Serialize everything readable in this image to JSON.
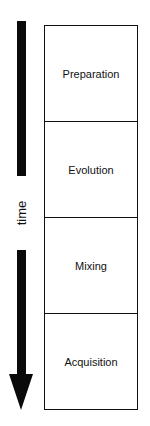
{
  "timeline": {
    "label": "time",
    "direction": "down"
  },
  "stages": [
    {
      "label": "Preparation"
    },
    {
      "label": "Evolution"
    },
    {
      "label": "Mixing"
    },
    {
      "label": "Acquisition"
    }
  ]
}
